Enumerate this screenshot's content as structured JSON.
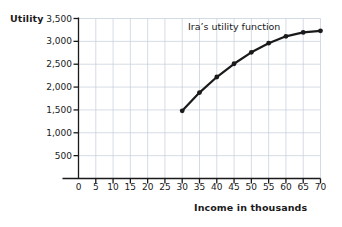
{
  "chart_data": {
    "type": "line",
    "title": "",
    "xlabel": "Income in thousands",
    "ylabel": "Utility",
    "annotation": "Ira’s utility function",
    "xlim": [
      0,
      70
    ],
    "ylim": [
      0,
      3500
    ],
    "xticks": [
      0,
      5,
      10,
      15,
      20,
      25,
      30,
      35,
      40,
      45,
      50,
      55,
      60,
      65,
      70
    ],
    "xtick_labels": [
      "0",
      "5",
      "10",
      "15",
      "20",
      "25",
      "30",
      "35",
      "40",
      "45",
      "50",
      "55",
      "60",
      "65",
      "70"
    ],
    "yticks": [
      0,
      500,
      1000,
      1500,
      2000,
      2500,
      3000,
      3500
    ],
    "ytick_labels": [
      "",
      "500",
      "1,000",
      "1,500",
      "2,000",
      "2,500",
      "3,000",
      "3,500"
    ],
    "grid": true,
    "legend": "none",
    "series": [
      {
        "name": "Ira’s utility function",
        "color": "#1a1a1a",
        "marker": "circle",
        "x": [
          30,
          35,
          40,
          45,
          50,
          55,
          60,
          65,
          70
        ],
        "values": [
          1480,
          1880,
          2220,
          2510,
          2760,
          2960,
          3110,
          3195,
          3230
        ]
      }
    ]
  },
  "labels": {
    "y_axis_title": "Utility",
    "x_axis_title": "Income in thousands",
    "annotation": "Ira’s utility function"
  },
  "colors": {
    "series": "#1a1a1a",
    "grid": "#c3cbd8",
    "axis": "#1a1a1a",
    "background": "#ffffff"
  }
}
